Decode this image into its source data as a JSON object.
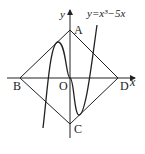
{
  "diagram": {
    "curve_label": "y=x³−5x",
    "axis_x_label": "x",
    "axis_y_label": "y",
    "points": {
      "A": "A",
      "B": "B",
      "C": "C",
      "D": "D",
      "O": "O"
    },
    "colors": {
      "stroke": "#222222",
      "background": "#ffffff"
    }
  }
}
